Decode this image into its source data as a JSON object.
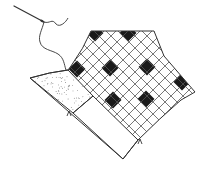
{
  "illustration": {
    "caption": "Needle and thread stitching a patchwork quilt block with a diagonal checkered grid",
    "colors": {
      "ink": "#333333",
      "fill": "#1a1a1a",
      "paper": "#ffffff"
    },
    "needle": {
      "x1": 14,
      "y1": 6,
      "x2": 44,
      "y2": 22
    },
    "thread_path": "M44,22 C50,24 52,18 56,24 C60,28 66,22 68,18 M44,22 C42,30 38,36 40,42 C42,50 52,50 58,54 C64,58 64,64 66,70",
    "patch_outline": "M91,31 L154,31 L164,56 L195,92 L181,100 Q160,118 138,140 L123,159 L30,78 Q50,72 68,70 L71,66 Q84,48 91,31 Z",
    "grid_region": "M91,31 L154,31 L164,56 L195,92 L181,100 Q160,118 138,140 L93,96 L68,70 Q84,48 91,31 Z",
    "stipple_region": "M30,78 Q50,72 68,70 L93,96 L73,113 Z",
    "plain_region": "M73,113 L93,96 L138,140 L123,159 Z",
    "grid": {
      "origin_x": 123,
      "origin_y": 0,
      "spacing": 12,
      "count": 26
    },
    "filled_cells": [
      {
        "cx": 95,
        "cy": 33
      },
      {
        "cx": 128,
        "cy": 33
      },
      {
        "cx": 77,
        "cy": 69
      },
      {
        "cx": 110,
        "cy": 68
      },
      {
        "cx": 147,
        "cy": 67
      },
      {
        "cx": 182,
        "cy": 82
      },
      {
        "cx": 113,
        "cy": 100
      },
      {
        "cx": 146,
        "cy": 99
      }
    ],
    "stitch_marks": [
      {
        "x": 69,
        "y": 113
      },
      {
        "x": 140,
        "y": 141
      }
    ]
  }
}
